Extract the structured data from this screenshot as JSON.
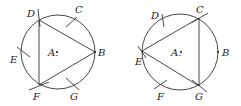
{
  "figures": [
    {
      "id": "left",
      "center_label": "A.",
      "points": {
        "B": "B",
        "C": "C",
        "D": "D",
        "E": "E",
        "F": "F",
        "G": "G"
      },
      "triangle": "DBF"
    },
    {
      "id": "right",
      "center_label": "A.",
      "points": {
        "B": "B",
        "C": "C",
        "D": "D",
        "E": "E",
        "F": "F",
        "G": "G"
      },
      "triangle": "CEG"
    }
  ],
  "colors": {
    "stroke": "#333333",
    "text": "#222222"
  }
}
